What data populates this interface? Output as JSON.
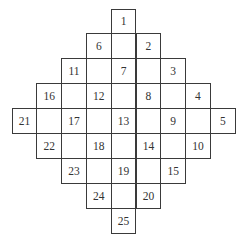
{
  "diagram": {
    "type": "diamond-grid",
    "rows": 9,
    "cols": 9,
    "cell_width": 24.8,
    "cell_height": 24.9,
    "origin_x": 12,
    "origin_y": 9,
    "line_color": "#3a3a3a",
    "text_color": "#333333",
    "labels": [
      {
        "n": "1",
        "row": 0,
        "col": 4
      },
      {
        "n": "6",
        "row": 1,
        "col": 3
      },
      {
        "n": "2",
        "row": 1,
        "col": 5
      },
      {
        "n": "11",
        "row": 2,
        "col": 2
      },
      {
        "n": "7",
        "row": 2,
        "col": 4
      },
      {
        "n": "3",
        "row": 2,
        "col": 6
      },
      {
        "n": "16",
        "row": 3,
        "col": 1
      },
      {
        "n": "12",
        "row": 3,
        "col": 3
      },
      {
        "n": "8",
        "row": 3,
        "col": 5
      },
      {
        "n": "4",
        "row": 3,
        "col": 7
      },
      {
        "n": "21",
        "row": 4,
        "col": 0
      },
      {
        "n": "17",
        "row": 4,
        "col": 2
      },
      {
        "n": "13",
        "row": 4,
        "col": 4
      },
      {
        "n": "9",
        "row": 4,
        "col": 6
      },
      {
        "n": "5",
        "row": 4,
        "col": 8
      },
      {
        "n": "22",
        "row": 5,
        "col": 1
      },
      {
        "n": "18",
        "row": 5,
        "col": 3
      },
      {
        "n": "14",
        "row": 5,
        "col": 5
      },
      {
        "n": "10",
        "row": 5,
        "col": 7
      },
      {
        "n": "23",
        "row": 6,
        "col": 2
      },
      {
        "n": "19",
        "row": 6,
        "col": 4
      },
      {
        "n": "15",
        "row": 6,
        "col": 6
      },
      {
        "n": "24",
        "row": 7,
        "col": 3
      },
      {
        "n": "20",
        "row": 7,
        "col": 5
      },
      {
        "n": "25",
        "row": 8,
        "col": 4
      }
    ]
  }
}
